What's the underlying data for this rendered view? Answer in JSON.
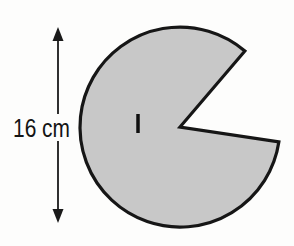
{
  "canvas": {
    "width": 294,
    "height": 246,
    "background": "#fdfdfc"
  },
  "figure": {
    "type": "pacman-sector-diagram",
    "circle": {
      "cx": 180,
      "cy": 127,
      "r": 100,
      "fill": "#c8c8c8",
      "stroke": "#161616",
      "stroke_width": 3.2
    },
    "sector_removed": {
      "start_angle_deg": -49.5,
      "end_angle_deg": 8.5,
      "vertex": "circle-center"
    },
    "tick_mark": {
      "x": 138,
      "y1": 114,
      "y2": 133,
      "stroke": "#101010",
      "stroke_width": 3.5
    },
    "dimension": {
      "label": "16 cm",
      "measures": "diameter",
      "color": "#141414",
      "label_x": 13,
      "label_y": 137,
      "label_font_size": 25,
      "label_length": 57,
      "arrow": {
        "x": 58,
        "tip_top_y": 27,
        "tip_bottom_y": 223,
        "head_half_width": 5.5,
        "head_length": 14,
        "line_top_start_y": 39,
        "line_gap_top_y": 114,
        "line_gap_bottom_y": 141,
        "line_bottom_end_y": 211,
        "stroke": "#1a1a1a",
        "stroke_width": 1.8
      }
    }
  }
}
